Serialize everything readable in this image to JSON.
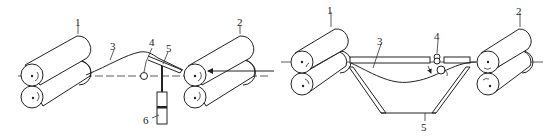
{
  "figures": [
    {
      "id": "left",
      "labels": {
        "roller_pair_1": "1",
        "roller_pair_2": "2",
        "strip": "3",
        "pivot": "4",
        "guide_plate": "5",
        "cylinder": "6"
      }
    },
    {
      "id": "right",
      "labels": {
        "roller_pair_1": "1",
        "roller_pair_2": "2",
        "strip": "3",
        "pinch_rolls": "4",
        "looper_pit": "5"
      }
    }
  ]
}
